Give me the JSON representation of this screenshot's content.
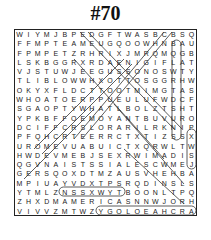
{
  "puzzle": {
    "title": "#70",
    "grid": [
      "WIYMJBPEDGFTWASBCBSQ",
      "FFMPTEAMEUGQOOWHNBAU",
      "FPMPETZRHRIXJMRQMQGB",
      "LSKBGGRXRDAENIGIFLAT",
      "VJSTUWJEEGUSSONOSWTY",
      "TLIBLOWWHXOTTOSGGRHW",
      "OKYXFLDCTTOOTMIMGTAS",
      "WHOATOERPPUEULUFWDCF",
      "SGAOPTYWHATLBOLZTSHT",
      "YPKBFFOEMOYANTBUVURO",
      "DCIFFCRSLORARILRKNIP",
      "PFQHCRTEERRCTXTIZSSX",
      "UROMEVUABUICTXQRWLTW",
      "HWDEVMEBJSEXRWIMADIS",
      "QGVNAISTSSIALESCWMEJ",
      "GERSQOXDTMZAUSVHEHBA",
      "MPIUAYVDXTPSRQDINSLS",
      "YTMLZNSSXWYTBOONLTPQ",
      "ZHXDMAMERICASNNWJORH",
      "VIVVZMTWZYGOLOEAHCRA"
    ],
    "found_words_visible": [
      "AMERICA",
      "ARCHAEOLOGY"
    ]
  }
}
